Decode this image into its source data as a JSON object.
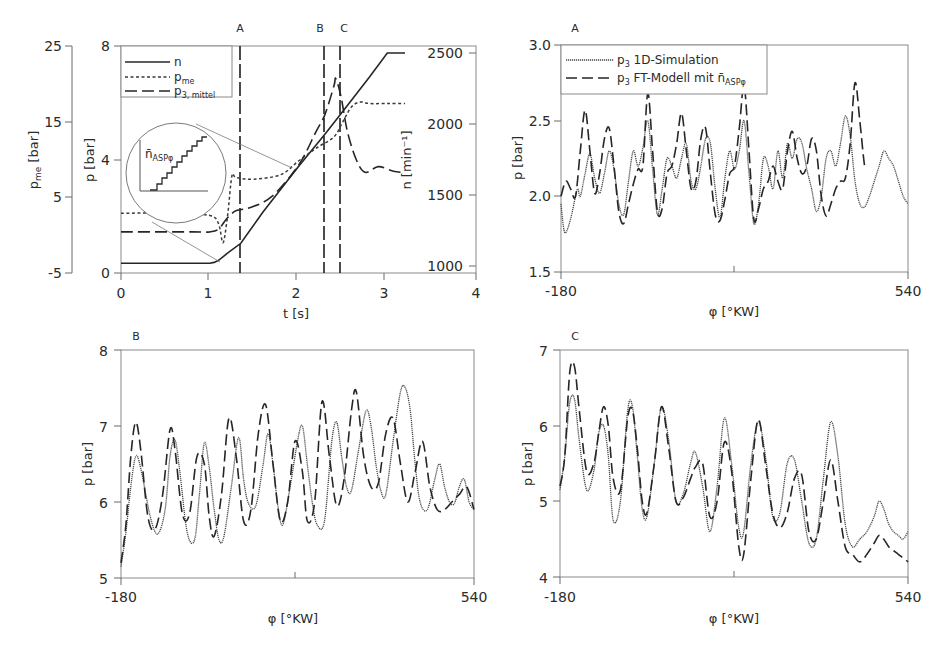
{
  "chart_data": [
    {
      "id": "overview",
      "type": "line",
      "title": "",
      "xlabel": "t [s]",
      "xlim": [
        0,
        4
      ],
      "xticks": [
        "0",
        "1",
        "2",
        "3",
        "4"
      ],
      "axes": {
        "p": {
          "label": "p [bar]",
          "ylim": [
            0,
            8
          ],
          "ticks": [
            "0",
            "4",
            "8"
          ]
        },
        "pme": {
          "label": "p_me [bar]",
          "ylim": [
            -5,
            25
          ],
          "ticks": [
            "-5",
            "5",
            "15",
            "25"
          ]
        },
        "n": {
          "label": "n [min⁻¹]",
          "ylim": [
            1000,
            2500
          ],
          "ticks": [
            "1000",
            "1500",
            "2000",
            "2500"
          ]
        }
      },
      "legend": [
        {
          "key": "n",
          "label": "n",
          "sub": "",
          "style": "solid"
        },
        {
          "key": "pme",
          "label": "p",
          "sub": "me",
          "style": "dotted"
        },
        {
          "key": "p3",
          "label": "p",
          "sub": "3, mittel",
          "style": "dashed"
        }
      ],
      "markers": [
        {
          "label": "A",
          "t": 1.35
        },
        {
          "label": "B",
          "t": 2.3
        },
        {
          "label": "C",
          "t": 2.48
        }
      ],
      "inset": {
        "label": "n̄",
        "sub": "ASPφ",
        "description": "staircase zoom of n"
      },
      "series": [
        {
          "name": "n",
          "axis": "n",
          "x": [
            0,
            1.0,
            1.05,
            1.1,
            1.2,
            1.35,
            1.6,
            2.0,
            2.3,
            2.5,
            2.8,
            3.0,
            3.2
          ],
          "y": [
            1020,
            1020,
            1025,
            1040,
            1090,
            1160,
            1380,
            1700,
            1930,
            2090,
            2330,
            2500,
            2500
          ]
        },
        {
          "name": "p_me",
          "axis": "pme",
          "x": [
            0,
            0.6,
            1.0,
            1.1,
            1.15,
            1.2,
            1.25,
            1.3,
            1.5,
            1.8,
            2.0,
            2.2,
            2.4,
            2.5,
            2.6,
            2.7,
            2.8,
            3.0,
            3.2
          ],
          "y": [
            2.9,
            2.9,
            2.6,
            1.5,
            -1.0,
            2.5,
            7.8,
            7.6,
            7.4,
            8.0,
            9.8,
            11.5,
            13.0,
            15.0,
            17.0,
            17.6,
            17.4,
            17.4,
            17.4
          ]
        },
        {
          "name": "p_3,mittel",
          "axis": "p",
          "x": [
            0,
            0.8,
            1.0,
            1.1,
            1.2,
            1.3,
            1.45,
            1.7,
            2.0,
            2.2,
            2.3,
            2.4,
            2.42,
            2.48,
            2.55,
            2.65,
            2.75,
            2.9,
            3.05,
            3.15
          ],
          "y": [
            1.45,
            1.45,
            1.45,
            1.55,
            1.95,
            2.2,
            2.3,
            2.7,
            3.8,
            5.0,
            5.6,
            6.6,
            6.85,
            6.2,
            5.0,
            4.0,
            3.55,
            3.75,
            3.6,
            3.55
          ]
        }
      ]
    },
    {
      "id": "A",
      "type": "line",
      "title": "A",
      "xlabel": "φ [°KW]",
      "ylabel": "p [bar]",
      "xlim": [
        -180,
        540
      ],
      "ylim": [
        1.5,
        3.0
      ],
      "xticks": [
        "-180",
        "540"
      ],
      "yticks": [
        "1.5",
        "2.0",
        "2.5",
        "3.0"
      ],
      "legend": [
        {
          "key": "sim",
          "label": "p",
          "sub": "3",
          "text": " 1D-Simulation",
          "style": "dotted"
        },
        {
          "key": "ft",
          "label": "p",
          "sub": "3",
          "text": " FT-Modell mit n̄",
          "sub2": "ASPφ",
          "style": "dashed"
        }
      ],
      "series": [
        {
          "name": "p3 1D-Simulation",
          "x": [
            -180,
            -175,
            -170,
            -160,
            -150,
            -145,
            -140,
            -130,
            -120,
            -110,
            -100,
            -90,
            -80,
            -70,
            -60,
            -50,
            -40,
            -30,
            -20,
            -10,
            0,
            10,
            20,
            30,
            40,
            50,
            60,
            70,
            80,
            90,
            100,
            110,
            120,
            130,
            140,
            150,
            160,
            170,
            180,
            190,
            200,
            210,
            220,
            230,
            240,
            250,
            260,
            270,
            280,
            290,
            300,
            310,
            320,
            330,
            340,
            350,
            360,
            370,
            380,
            390,
            400,
            410,
            420,
            430,
            440,
            450,
            460,
            470,
            480,
            490,
            500,
            510,
            520,
            530,
            540
          ],
          "y": [
            1.95,
            1.8,
            1.76,
            1.85,
            2.0,
            2.05,
            2.0,
            2.15,
            2.28,
            2.12,
            2.02,
            2.15,
            2.3,
            2.18,
            1.95,
            1.88,
            2.1,
            2.3,
            2.2,
            2.32,
            2.5,
            2.18,
            1.88,
            2.05,
            2.25,
            2.2,
            2.12,
            2.25,
            2.35,
            2.1,
            2.05,
            2.2,
            2.38,
            2.35,
            2.05,
            1.86,
            2.12,
            2.3,
            2.18,
            2.3,
            2.5,
            2.15,
            1.82,
            1.95,
            2.25,
            2.2,
            2.05,
            2.3,
            2.12,
            2.35,
            2.25,
            2.38,
            2.35,
            2.18,
            2.05,
            1.9,
            2.0,
            2.25,
            2.3,
            2.2,
            2.35,
            2.53,
            2.4,
            2.1,
            1.95,
            1.93,
            2.0,
            2.1,
            2.2,
            2.3,
            2.25,
            2.2,
            2.1,
            2.0,
            1.95
          ]
        },
        {
          "name": "p3 FT-Modell",
          "x": [
            -180,
            -170,
            -160,
            -150,
            -140,
            -130,
            -120,
            -110,
            -100,
            -90,
            -80,
            -70,
            -60,
            -50,
            -40,
            -30,
            -20,
            -10,
            0,
            10,
            20,
            30,
            40,
            50,
            60,
            70,
            80,
            90,
            100,
            110,
            120,
            130,
            140,
            150,
            160,
            170,
            180,
            190,
            200,
            210,
            220,
            230,
            240,
            250,
            260,
            270,
            280,
            290,
            300,
            310,
            320,
            330,
            340,
            350,
            360,
            370,
            380,
            390,
            400,
            410,
            420,
            430,
            440,
            450,
            460,
            470,
            480,
            490,
            500,
            510,
            520,
            530,
            540
          ],
          "y": [
            2.0,
            2.1,
            2.05,
            2.0,
            2.3,
            2.57,
            2.3,
            2.02,
            2.15,
            2.38,
            2.45,
            2.2,
            1.9,
            1.82,
            1.95,
            2.08,
            2.18,
            2.2,
            2.68,
            2.3,
            1.9,
            1.92,
            2.15,
            2.2,
            2.35,
            2.55,
            2.3,
            2.05,
            2.1,
            2.38,
            2.45,
            2.15,
            1.88,
            1.84,
            1.98,
            2.15,
            2.2,
            2.45,
            2.73,
            2.3,
            1.85,
            1.92,
            2.05,
            2.1,
            2.2,
            2.1,
            2.05,
            2.3,
            2.43,
            2.25,
            2.15,
            2.2,
            2.38,
            2.3,
            2.0,
            1.87,
            1.95,
            2.05,
            2.1,
            2.12,
            2.35,
            2.75,
            2.5,
            2.2,
            2.05
          ]
        }
      ]
    },
    {
      "id": "B",
      "type": "line",
      "title": "B",
      "xlabel": "φ [°KW]",
      "ylabel": "p [bar]",
      "xlim": [
        -180,
        540
      ],
      "ylim": [
        5,
        8
      ],
      "xticks": [
        "-180",
        "540"
      ],
      "yticks": [
        "5",
        "6",
        "7",
        "8"
      ],
      "series": [
        {
          "name": "p3 1D-Simulation",
          "x": [
            -180,
            -170,
            -160,
            -150,
            -140,
            -120,
            -105,
            -90,
            -80,
            -70,
            -60,
            -45,
            -30,
            -20,
            -10,
            0,
            10,
            20,
            30,
            45,
            60,
            70,
            80,
            95,
            110,
            120,
            130,
            140,
            150,
            165,
            180,
            190,
            200,
            210,
            220,
            235,
            250,
            260,
            270,
            280,
            290,
            305,
            320,
            330,
            340,
            350,
            360,
            375,
            390,
            400,
            410,
            420,
            430,
            445,
            460,
            470,
            480,
            490,
            500,
            510,
            520,
            530,
            540
          ],
          "y": [
            5.15,
            5.6,
            6.2,
            6.6,
            6.45,
            5.8,
            5.58,
            5.9,
            6.6,
            6.82,
            6.4,
            5.6,
            5.5,
            6.1,
            6.78,
            6.45,
            5.9,
            5.5,
            5.55,
            6.2,
            6.85,
            6.3,
            5.98,
            5.95,
            6.5,
            6.9,
            6.5,
            5.95,
            5.7,
            6.2,
            6.8,
            7.0,
            6.5,
            6.0,
            5.7,
            5.75,
            6.8,
            7.05,
            6.6,
            6.2,
            6.15,
            6.7,
            7.2,
            7.0,
            6.5,
            6.15,
            6.1,
            6.8,
            7.45,
            7.5,
            7.2,
            6.5,
            6.0,
            5.9,
            6.3,
            6.5,
            6.2,
            6.0,
            5.98,
            6.2,
            6.3,
            6.0,
            5.9
          ]
        },
        {
          "name": "p3 FT-Modell",
          "x": [
            -180,
            -170,
            -160,
            -150,
            -140,
            -125,
            -110,
            -95,
            -80,
            -70,
            -55,
            -40,
            -25,
            -10,
            0,
            10,
            25,
            40,
            55,
            70,
            85,
            100,
            115,
            130,
            145,
            160,
            175,
            190,
            200,
            215,
            230,
            245,
            260,
            275,
            290,
            300,
            315,
            330,
            345,
            360,
            375,
            390,
            405,
            420,
            435,
            450,
            465,
            480,
            495,
            510,
            525,
            540
          ],
          "y": [
            5.2,
            5.7,
            6.6,
            7.05,
            6.7,
            5.8,
            5.65,
            6.1,
            6.95,
            6.7,
            5.85,
            5.85,
            6.6,
            6.5,
            5.8,
            5.55,
            6.1,
            7.1,
            6.6,
            5.75,
            5.9,
            6.9,
            7.28,
            6.5,
            5.75,
            6.0,
            6.8,
            6.4,
            5.75,
            6.0,
            7.32,
            6.6,
            5.95,
            6.3,
            7.2,
            7.45,
            6.6,
            6.2,
            6.25,
            6.9,
            7.1,
            6.5,
            6.0,
            6.4,
            6.8,
            6.2,
            5.9,
            5.9,
            6.0,
            6.1,
            6.2,
            5.9
          ]
        }
      ]
    },
    {
      "id": "C",
      "type": "line",
      "title": "C",
      "xlabel": "φ [°KW]",
      "ylabel": "p [bar]",
      "xlim": [
        -180,
        540
      ],
      "ylim": [
        4,
        7
      ],
      "xticks": [
        "-180",
        "540"
      ],
      "yticks": [
        "4",
        "5",
        "6",
        "7"
      ],
      "series": [
        {
          "name": "p3 1D-Simulation",
          "x": [
            -180,
            -170,
            -160,
            -150,
            -140,
            -125,
            -110,
            -100,
            -90,
            -80,
            -70,
            -55,
            -40,
            -30,
            -20,
            -10,
            0,
            15,
            30,
            45,
            60,
            75,
            90,
            100,
            115,
            130,
            145,
            160,
            175,
            190,
            200,
            215,
            230,
            245,
            260,
            275,
            290,
            305,
            320,
            335,
            350,
            365,
            380,
            395,
            410,
            425,
            440,
            455,
            470,
            480,
            490,
            500,
            510,
            520,
            530,
            540
          ],
          "y": [
            5.15,
            5.6,
            6.3,
            6.35,
            5.8,
            5.15,
            5.4,
            5.9,
            6.0,
            5.6,
            4.75,
            5.0,
            6.2,
            6.25,
            5.6,
            4.9,
            4.8,
            5.5,
            6.25,
            5.8,
            5.0,
            5.1,
            5.5,
            5.65,
            5.2,
            4.6,
            5.2,
            6.1,
            5.5,
            4.65,
            4.6,
            5.5,
            6.05,
            5.6,
            4.8,
            4.85,
            5.5,
            5.55,
            5.0,
            4.45,
            4.5,
            5.3,
            6.05,
            5.6,
            4.7,
            4.4,
            4.5,
            4.6,
            4.8,
            5.0,
            4.9,
            4.7,
            4.6,
            4.55,
            4.5,
            4.6
          ]
        },
        {
          "name": "p3 FT-Modell",
          "x": [
            -180,
            -170,
            -160,
            -150,
            -140,
            -125,
            -110,
            -100,
            -90,
            -80,
            -70,
            -55,
            -40,
            -30,
            -20,
            -10,
            0,
            15,
            30,
            45,
            60,
            75,
            90,
            100,
            115,
            130,
            145,
            160,
            175,
            190,
            200,
            215,
            230,
            245,
            260,
            275,
            290,
            305,
            320,
            335,
            350,
            365,
            380,
            395,
            410,
            425,
            440,
            455,
            470,
            480,
            490,
            500,
            510,
            520,
            530,
            540
          ],
          "y": [
            5.2,
            5.6,
            6.7,
            6.78,
            6.2,
            5.4,
            5.5,
            5.9,
            6.25,
            6.0,
            5.3,
            5.15,
            6.1,
            6.2,
            5.7,
            5.0,
            4.85,
            5.5,
            6.25,
            5.7,
            5.0,
            5.05,
            5.3,
            5.45,
            5.5,
            4.8,
            5.0,
            5.78,
            5.4,
            4.4,
            4.3,
            5.3,
            6.08,
            5.5,
            4.85,
            4.65,
            4.85,
            5.3,
            5.35,
            4.6,
            4.5,
            5.0,
            5.55,
            5.0,
            4.4,
            4.3,
            4.2,
            4.3,
            4.45,
            4.55,
            4.5,
            4.4,
            4.35,
            4.3,
            4.25,
            4.2
          ]
        }
      ]
    }
  ]
}
